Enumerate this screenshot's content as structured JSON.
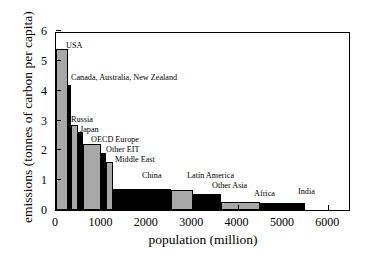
{
  "chart_data": {
    "type": "bar",
    "title": "",
    "subtitle": "",
    "xlabel": "population (million)",
    "ylabel": "emissions (tonnes of carbon per capita)",
    "xlim": [
      0,
      6500
    ],
    "ylim": [
      0,
      6
    ],
    "xticks": [
      0,
      1000,
      2000,
      3000,
      4000,
      5000,
      6000
    ],
    "xtick_labels": [
      "0",
      "1000",
      "2000",
      "3000",
      "4000",
      "5000",
      "6000"
    ],
    "yticks": [
      0,
      1,
      2,
      3,
      4,
      5,
      6
    ],
    "ytick_labels": [
      "0",
      "1",
      "2",
      "3",
      "4",
      "5",
      "6"
    ],
    "grid": false,
    "legend": null,
    "note": "Variable-width (Marimekko-style) bar chart: bar width = population, bar height = per-capita carbon emissions, bars sorted descending by emissions and laid end to end along cumulative population.",
    "categories": [
      "USA",
      "Canada, Australia, New Zealand",
      "Russia",
      "Japan",
      "OECD Europe",
      "Other EIT",
      "Middle East",
      "China",
      "Latin America",
      "Other Asia",
      "Africa",
      "India"
    ],
    "values": [
      5.4,
      4.2,
      2.85,
      2.6,
      2.2,
      1.9,
      1.6,
      0.72,
      0.67,
      0.55,
      0.27,
      0.25
    ],
    "widths": [
      270,
      60,
      150,
      125,
      390,
      100,
      160,
      1270,
      500,
      620,
      850,
      1000
    ],
    "bars": [
      {
        "label": "USA",
        "x_start": 0,
        "x_end": 270,
        "value": 5.4,
        "color": "gray"
      },
      {
        "label": "Canada, Australia, New Zealand",
        "x_start": 270,
        "x_end": 330,
        "value": 4.2,
        "color": "black"
      },
      {
        "label": "Russia",
        "x_start": 330,
        "x_end": 480,
        "value": 2.85,
        "color": "gray"
      },
      {
        "label": "Japan",
        "x_start": 480,
        "x_end": 605,
        "value": 2.6,
        "color": "black"
      },
      {
        "label": "OECD Europe",
        "x_start": 605,
        "x_end": 995,
        "value": 2.2,
        "color": "gray"
      },
      {
        "label": "Other EIT",
        "x_start": 995,
        "x_end": 1095,
        "value": 1.9,
        "color": "black"
      },
      {
        "label": "Middle East",
        "x_start": 1095,
        "x_end": 1255,
        "value": 1.6,
        "color": "gray"
      },
      {
        "label": "China",
        "x_start": 1255,
        "x_end": 2525,
        "value": 0.72,
        "color": "black"
      },
      {
        "label": "Latin America",
        "x_start": 2525,
        "x_end": 3025,
        "value": 0.67,
        "color": "gray"
      },
      {
        "label": "Other Asia",
        "x_start": 3025,
        "x_end": 3645,
        "value": 0.55,
        "color": "black"
      },
      {
        "label": "Africa",
        "x_start": 3645,
        "x_end": 4495,
        "value": 0.27,
        "color": "gray"
      },
      {
        "label": "India",
        "x_start": 4495,
        "x_end": 5495,
        "value": 0.25,
        "color": "black"
      }
    ],
    "annotations": [
      {
        "text": "USA",
        "x_px": 65,
        "y_px": 40
      },
      {
        "text": "Canada, Australia, New Zealand",
        "x_px": 70,
        "y_px": 72
      },
      {
        "text": "Russia",
        "x_px": 70,
        "y_px": 114
      },
      {
        "text": "Japan",
        "x_px": 79,
        "y_px": 124
      },
      {
        "text": "OECD Europe",
        "x_px": 90,
        "y_px": 134
      },
      {
        "text": "Other EIT",
        "x_px": 105,
        "y_px": 144
      },
      {
        "text": "Middle East",
        "x_px": 114,
        "y_px": 154
      },
      {
        "text": "China",
        "x_px": 141,
        "y_px": 170
      },
      {
        "text": "Latin America",
        "x_px": 186,
        "y_px": 170
      },
      {
        "text": "Other Asia",
        "x_px": 211,
        "y_px": 180
      },
      {
        "text": "Africa",
        "x_px": 253,
        "y_px": 188
      },
      {
        "text": "India",
        "x_px": 297,
        "y_px": 186
      }
    ],
    "colors": {
      "gray_bar": "#a8a8a8",
      "black_bar": "#000000",
      "axis": "#000000",
      "background": "#ffffff"
    }
  }
}
